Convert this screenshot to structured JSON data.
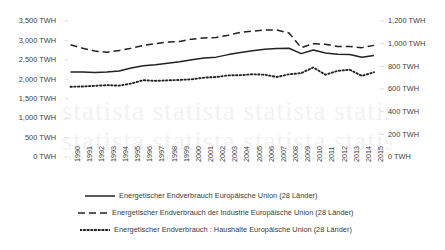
{
  "chart_data": {
    "type": "line",
    "title": "",
    "subtitle": "",
    "xlabel": "",
    "ylabel": "",
    "grid": false,
    "legend_position": "bottom",
    "x": [
      1990,
      1991,
      1992,
      1993,
      1994,
      1995,
      1996,
      1997,
      1998,
      1999,
      2000,
      2001,
      2002,
      2003,
      2004,
      2005,
      2006,
      2007,
      2008,
      2009,
      2010,
      2011,
      2012,
      2013,
      2014,
      2015
    ],
    "categories": [
      "1990",
      "1991",
      "1992",
      "1993",
      "1994",
      "1995",
      "1996",
      "1997",
      "1998",
      "1999",
      "2000",
      "2001",
      "2002",
      "2003",
      "2004",
      "2005",
      "2006",
      "2007",
      "2008",
      "2009",
      "2010",
      "2011",
      "2012",
      "2013",
      "2014",
      "2015"
    ],
    "axes": {
      "left": {
        "unit": "TWH",
        "ticks": [
          "3,500 TWH",
          "3,000 TWH",
          "2,500 TWH",
          "2,000 TWH",
          "1,500 TWH",
          "1,000 TWH",
          "500 TWH",
          "0 TWH"
        ],
        "tick_values": [
          3500,
          3000,
          2500,
          2000,
          1500,
          1000,
          500,
          0
        ],
        "ylim": [
          0,
          3500
        ]
      },
      "right": {
        "unit": "TWH",
        "ticks": [
          "1,200 TWH",
          "1,000 TWH",
          "800 TWH",
          "600 TWH",
          "400 TWH",
          "200 TWH",
          "0 TWH"
        ],
        "tick_values": [
          1200,
          1000,
          800,
          600,
          400,
          200,
          0
        ],
        "ylim": [
          0,
          1200
        ]
      }
    },
    "series": [
      {
        "name": "Energetischer Endverbrauch Europäische Union (28 Länder)",
        "axis": "left",
        "style": "solid",
        "color": "#222222",
        "values": [
          2190,
          2185,
          2175,
          2185,
          2215,
          2290,
          2350,
          2375,
          2410,
          2450,
          2505,
          2545,
          2570,
          2635,
          2690,
          2735,
          2775,
          2790,
          2800,
          2660,
          2755,
          2675,
          2645,
          2640,
          2565,
          2615
        ]
      },
      {
        "name": "Energetischer Endverbrauch der Industrie Europäische Union (28 Länder)",
        "axis": "right",
        "style": "dashed",
        "color": "#222222",
        "values": [
          990,
          960,
          935,
          925,
          940,
          960,
          985,
          1000,
          1015,
          1020,
          1040,
          1050,
          1055,
          1075,
          1100,
          1110,
          1120,
          1120,
          1095,
          965,
          1000,
          995,
          975,
          975,
          965,
          985
        ]
      },
      {
        "name": "Energetischer Endverbrauch : Haushalte Europäische Union (28 Länder)",
        "axis": "right",
        "style": "dotted",
        "color": "#222222",
        "values": [
          620,
          622,
          628,
          634,
          630,
          648,
          678,
          672,
          676,
          680,
          686,
          700,
          706,
          720,
          722,
          730,
          726,
          706,
          730,
          740,
          790,
          726,
          760,
          770,
          716,
          748
        ]
      }
    ]
  },
  "legend": {
    "items": [
      {
        "label": "Energetischer Endverbrauch Europäische Union (28 Länder)",
        "style": "solid"
      },
      {
        "label": "Energetischer Endverbrauch der Industrie Europäische Union (28 Länder)",
        "style": "dashed"
      },
      {
        "label": "Energetischer Endverbrauch : Haushalte Europäische Union (28 Länder)",
        "style": "dotted"
      }
    ]
  },
  "watermark": {
    "text": "statista"
  }
}
